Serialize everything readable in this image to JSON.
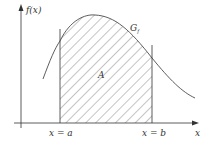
{
  "diagram": {
    "y_axis_label": "f(x)",
    "x_axis_label": "x",
    "curve_label": "G",
    "curve_label_subscript": "f",
    "area_label": "A",
    "left_bound_label": "x = a",
    "right_bound_label": "x = b",
    "colors": {
      "stroke": "#333333",
      "hatch": "#555555",
      "background": "#ffffff"
    }
  }
}
